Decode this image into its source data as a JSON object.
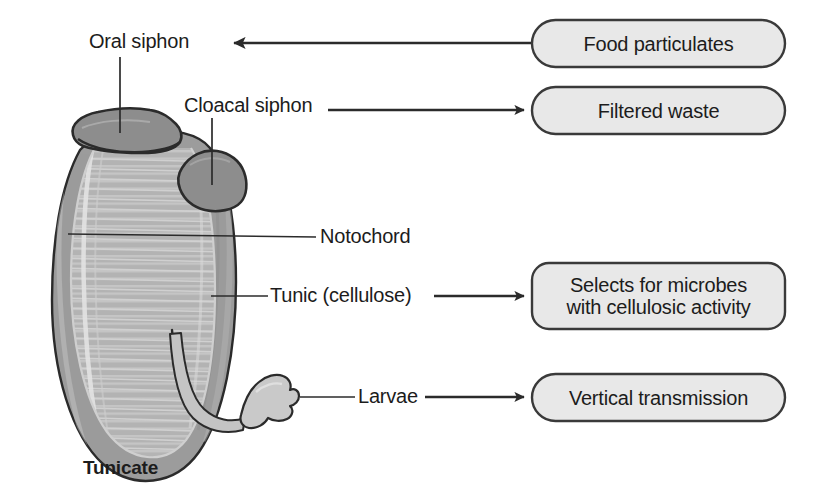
{
  "figure": {
    "caption": "Tunicate",
    "organism_name": "Tunicate"
  },
  "colors": {
    "box_fill": "#e8e8e8",
    "box_stroke": "#3a3a3a",
    "text": "#1c1c1c",
    "tunic_outer": "#9a9a9a",
    "tunic_inner": "#b3b3b3",
    "siphon_dark": "#8a8a8a",
    "larva_fill": "#c6c6c6",
    "outline": "#2b2b2b",
    "leader_line": "#2b2b2b"
  },
  "parts": [
    {
      "id": "oral-siphon",
      "label": "Oral siphon"
    },
    {
      "id": "cloacal-siphon",
      "label": "Cloacal siphon"
    },
    {
      "id": "notochord",
      "label": "Notochord"
    },
    {
      "id": "tunic",
      "label": "Tunic (cellulose)"
    },
    {
      "id": "larvae",
      "label": "Larvae"
    }
  ],
  "outcome_boxes": [
    {
      "id": "food-particulates",
      "text": "Food particulates",
      "lines": 1
    },
    {
      "id": "filtered-waste",
      "text": "Filtered waste",
      "lines": 1
    },
    {
      "id": "selects-microbes",
      "text": "Selects for microbes\nwith cellulosic activity",
      "lines": 2
    },
    {
      "id": "vertical-transmission",
      "text": "Vertical transmission",
      "lines": 1
    }
  ],
  "flows": [
    {
      "from": "food-particulates",
      "to": "oral-siphon",
      "direction": "left"
    },
    {
      "from": "cloacal-siphon",
      "to": "filtered-waste",
      "direction": "right"
    },
    {
      "from": "tunic",
      "to": "selects-microbes",
      "direction": "right"
    },
    {
      "from": "larvae",
      "to": "vertical-transmission",
      "direction": "right"
    }
  ]
}
